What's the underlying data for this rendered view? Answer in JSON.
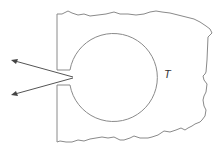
{
  "diagram": {
    "type": "cavity-radiation",
    "temperature_label": "T",
    "elements": {
      "block": "irregular solid body with broken (jagged) edges",
      "cavity": "circular hollow inside the block",
      "opening": "small hole on the left wall connecting cavity to outside",
      "rays": 2
    },
    "colors": {
      "outline": "#8a8a8a",
      "arrows": "#555555",
      "text": "#333333"
    }
  }
}
